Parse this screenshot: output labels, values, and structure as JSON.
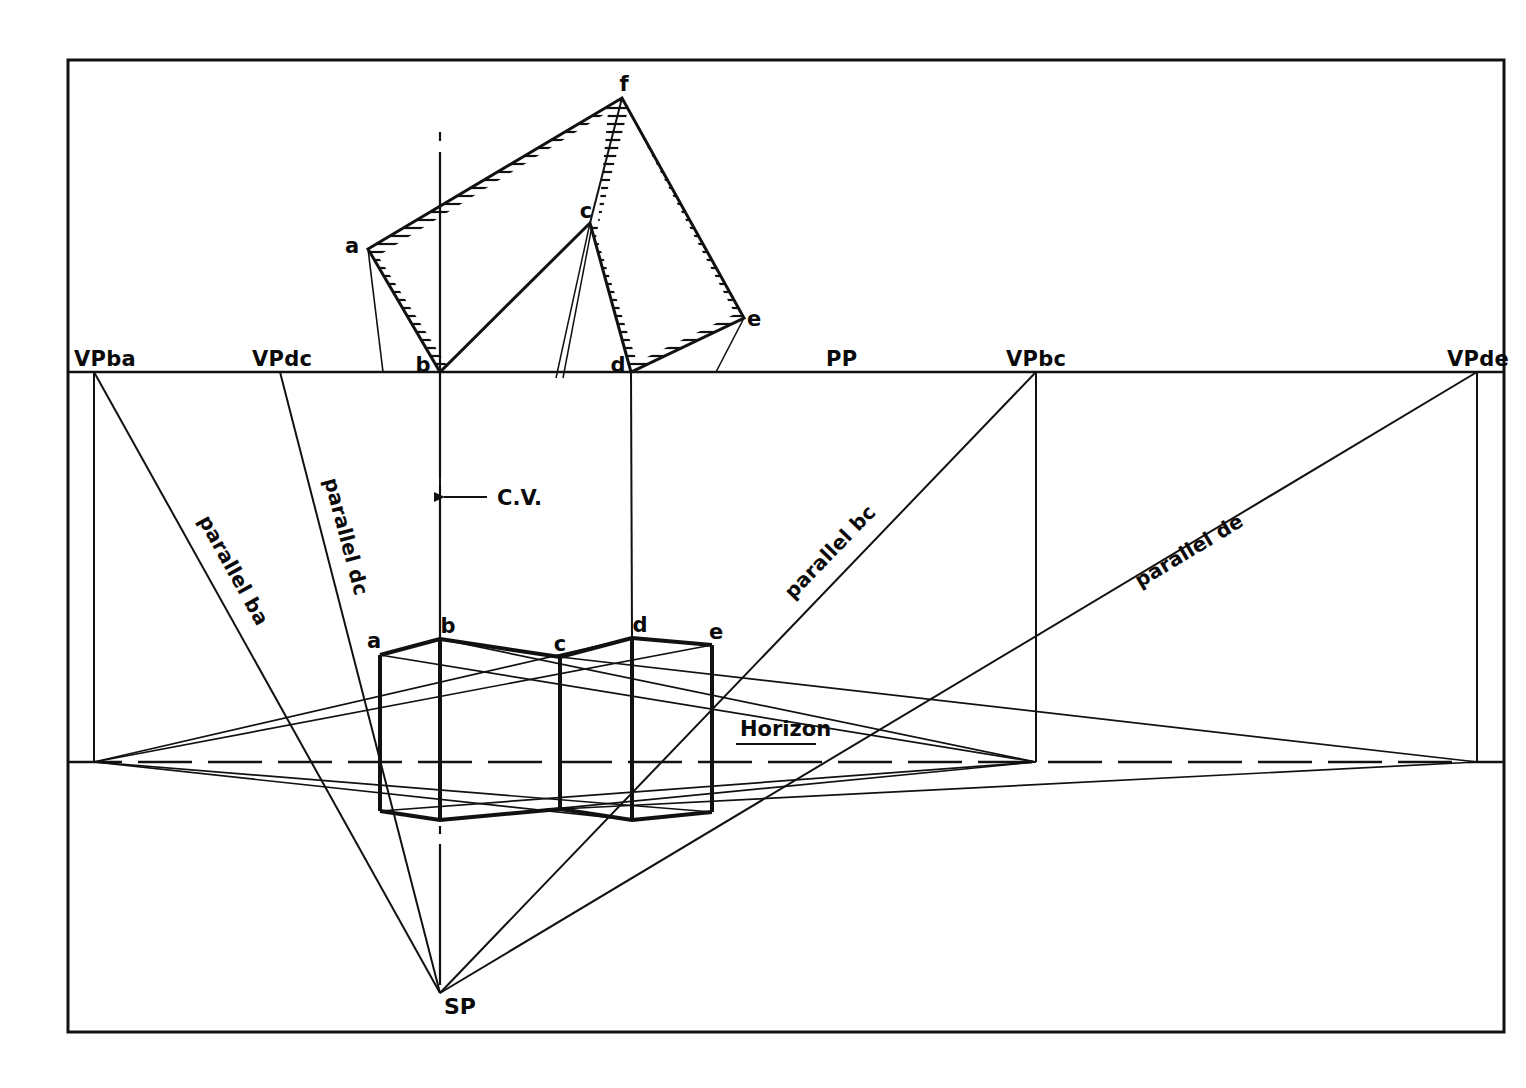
{
  "drawing": {
    "title": "Two-point perspective construction of a folded prism",
    "background": "#ffffff",
    "ink": "#0d0d0d",
    "border": {
      "x": 68,
      "y": 60,
      "width": 1436,
      "height": 972
    }
  },
  "picture_plane": {
    "label": "PP",
    "label_x": 840,
    "label_y": 365,
    "y": 372,
    "x_start": 68,
    "x_end": 1504
  },
  "horizon": {
    "label": "Horizon",
    "label_x": 740,
    "label_y": 736,
    "y": 762,
    "x_start": 68,
    "x_end": 1504
  },
  "center_of_vision": {
    "label": "C.V.",
    "label_x": 497,
    "label_y": 504,
    "arrow_y": 497,
    "line_x": 440,
    "line_top": 132,
    "line_bottom": 985
  },
  "station_point": {
    "label": "SP",
    "x": 440,
    "y": 993,
    "label_x": 447,
    "label_y": 1013
  },
  "vanishing_points": [
    {
      "name": "VP ba",
      "label": "VPba",
      "x": 94,
      "label_x": 74,
      "label_y": 365
    },
    {
      "name": "VP dc",
      "label": "VPdc",
      "x": 280,
      "label_x": 252,
      "label_y": 365
    },
    {
      "name": "VP bc",
      "label": "VPbc",
      "x": 1036,
      "label_x": 1008,
      "label_y": 365
    },
    {
      "name": "VP de",
      "label": "VPde",
      "x": 1477,
      "label_x": 1449,
      "label_y": 365
    }
  ],
  "parallel_rays": [
    {
      "label": "parallel ba",
      "from_x": 94,
      "from_y": 372,
      "to_x": 440,
      "to_y": 993,
      "label_x": 200,
      "label_y": 545,
      "rotate": 61
    },
    {
      "label": "parallel dc",
      "from_x": 280,
      "from_y": 372,
      "to_x": 440,
      "to_y": 993,
      "label_x": 333,
      "label_y": 545,
      "rotate": 76
    },
    {
      "label": "parallel bc",
      "from_x": 1036,
      "from_y": 372,
      "to_x": 440,
      "to_y": 993,
      "label_x": 828,
      "label_y": 570,
      "rotate": -46
    },
    {
      "label": "parallel de",
      "from_x": 1477,
      "from_y": 372,
      "to_x": 440,
      "to_y": 993,
      "label_x": 1180,
      "label_y": 562,
      "rotate": -31
    }
  ],
  "plan_view": {
    "name": "plan-view-hatched-prism",
    "points": {
      "a": {
        "x": 368,
        "y": 249,
        "label": "a",
        "label_x": 352,
        "label_y": 246
      },
      "b": {
        "x": 440,
        "y": 372,
        "label": "b",
        "label_x": 421,
        "label_y": 370
      },
      "c": {
        "x": 590,
        "y": 223,
        "label": "c",
        "label_x": 584,
        "label_y": 216
      },
      "d": {
        "x": 631,
        "y": 372,
        "label": "d",
        "label_x": 615,
        "label_y": 370
      },
      "e": {
        "x": 744,
        "y": 318,
        "label": "e",
        "label_x": 750,
        "label_y": 322
      },
      "f": {
        "x": 622,
        "y": 98,
        "label": "f",
        "label_x": 622,
        "label_y": 88
      }
    },
    "outline": "a-f-e-d-c-b-a",
    "hatch": {
      "style": "horizontal-lines",
      "spacing": 8
    }
  },
  "perspective_view": {
    "name": "perspective-prism",
    "top": {
      "a": {
        "x": 380,
        "y": 655,
        "label": "a",
        "label_x": 372,
        "label_y": 645
      },
      "b": {
        "x": 440,
        "y": 639,
        "label": "b",
        "label_x": 444,
        "label_y": 630
      },
      "c": {
        "x": 560,
        "y": 657,
        "label": "c",
        "label_x": 556,
        "label_y": 648
      },
      "d": {
        "x": 632,
        "y": 638,
        "label": "d",
        "label_x": 636,
        "label_y": 630
      },
      "e": {
        "x": 712,
        "y": 645,
        "label": "e",
        "label_x": 712,
        "label_y": 636
      }
    },
    "bottom": {
      "a": {
        "x": 380,
        "y": 811
      },
      "b": {
        "x": 440,
        "y": 820
      },
      "c": {
        "x": 560,
        "y": 809
      },
      "d": {
        "x": 632,
        "y": 820
      },
      "e": {
        "x": 712,
        "y": 812
      }
    }
  },
  "projector_lines": {
    "description": "vertical projectors from plan points down to perspective view",
    "verticals": [
      {
        "from": "b-plan",
        "x": 440
      },
      {
        "from": "d-plan",
        "x": 631
      }
    ]
  }
}
